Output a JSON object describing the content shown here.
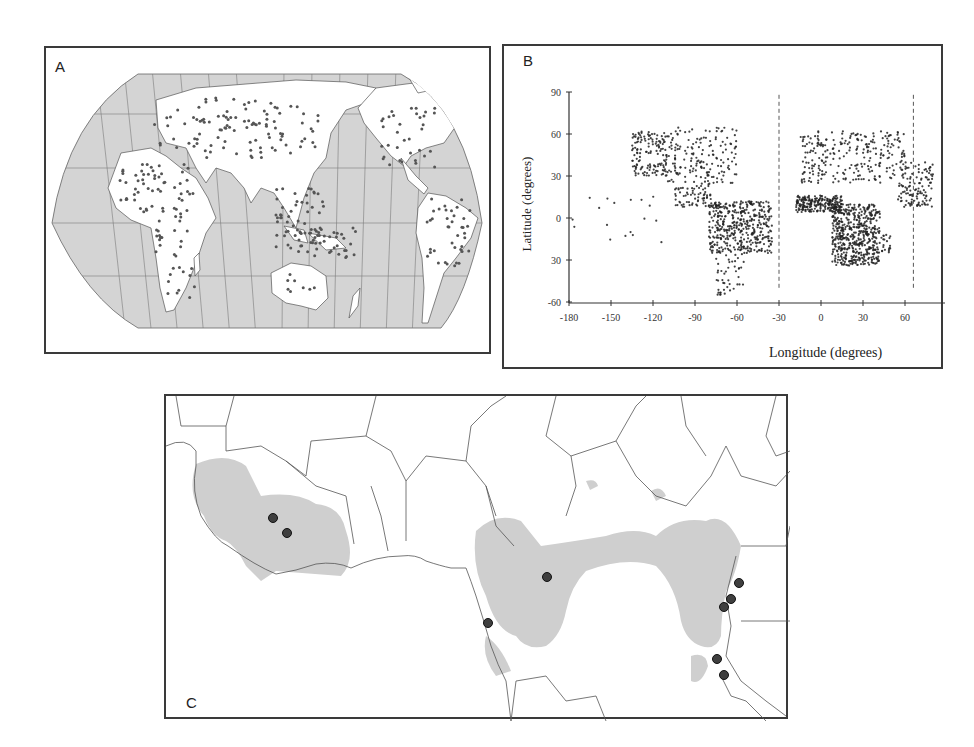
{
  "figure": {
    "panels": [
      {
        "id": "A",
        "label": "A",
        "kind": "world-map",
        "description": "Global occurrence points on Pacific-centered world map"
      },
      {
        "id": "B",
        "label": "B",
        "kind": "scatter",
        "description": "Occurrence records plotted by longitude and latitude"
      },
      {
        "id": "C",
        "label": "C",
        "kind": "regional-map",
        "description": "West and Central Africa range map with sample locations"
      }
    ],
    "colors": {
      "ocean": "#d4d4d4",
      "land": "#ffffff",
      "graticule": "#7a7a7a",
      "point": "#555555",
      "range": "#cfcfcf",
      "sample_dot": "#3f3f3f",
      "border": "#3a3a3a"
    }
  },
  "chart_data": {
    "type": "scatter",
    "title": "",
    "xlabel": "Longitude (degrees)",
    "ylabel": "Latitude (degrees)",
    "xlim": [
      -180,
      80
    ],
    "ylim": [
      -60,
      90
    ],
    "x_ticks": [
      "-180",
      "-150",
      "-120",
      "-90",
      "-60",
      "-30",
      "0",
      "30",
      "60"
    ],
    "y_ticks": [
      "90",
      "60",
      "30",
      "0",
      "30",
      "-60"
    ],
    "reference_lines": [
      {
        "orientation": "vertical",
        "x": -30,
        "style": "dashed"
      },
      {
        "orientation": "vertical",
        "x": 66,
        "style": "dashed"
      }
    ],
    "grid": false,
    "clusters": [
      {
        "name": "North America west coast",
        "x": [
          -135,
          -110
        ],
        "y": [
          30,
          62
        ],
        "n": 140
      },
      {
        "name": "North America interior",
        "x": [
          -110,
          -60
        ],
        "y": [
          25,
          65
        ],
        "n": 170
      },
      {
        "name": "Central America",
        "x": [
          -105,
          -78
        ],
        "y": [
          8,
          25
        ],
        "n": 70
      },
      {
        "name": "South America north",
        "x": [
          -80,
          -35
        ],
        "y": [
          -25,
          12
        ],
        "n": 420
      },
      {
        "name": "South America south",
        "x": [
          -75,
          -55
        ],
        "y": [
          -55,
          -25
        ],
        "n": 45
      },
      {
        "name": "Pacific islands",
        "x": [
          -178,
          -110
        ],
        "y": [
          -28,
          20
        ],
        "n": 18
      },
      {
        "name": "West Africa",
        "x": [
          -18,
          15
        ],
        "y": [
          4,
          16
        ],
        "n": 220
      },
      {
        "name": "North Africa / Europe",
        "x": [
          -15,
          60
        ],
        "y": [
          25,
          62
        ],
        "n": 260
      },
      {
        "name": "East & Central Africa",
        "x": [
          8,
          42
        ],
        "y": [
          -34,
          10
        ],
        "n": 520
      },
      {
        "name": "Madagascar",
        "x": [
          43,
          50
        ],
        "y": [
          -25,
          -12
        ],
        "n": 20
      },
      {
        "name": "Arabia / South Asia",
        "x": [
          55,
          80
        ],
        "y": [
          8,
          40
        ],
        "n": 120
      }
    ]
  },
  "panel_c": {
    "sample_sites": [
      {
        "x": 271,
        "y": 516
      },
      {
        "x": 285,
        "y": 531
      },
      {
        "x": 545,
        "y": 575
      },
      {
        "x": 486,
        "y": 621
      },
      {
        "x": 737,
        "y": 581
      },
      {
        "x": 729,
        "y": 597
      },
      {
        "x": 722,
        "y": 605
      },
      {
        "x": 715,
        "y": 657
      },
      {
        "x": 722,
        "y": 673
      }
    ]
  }
}
